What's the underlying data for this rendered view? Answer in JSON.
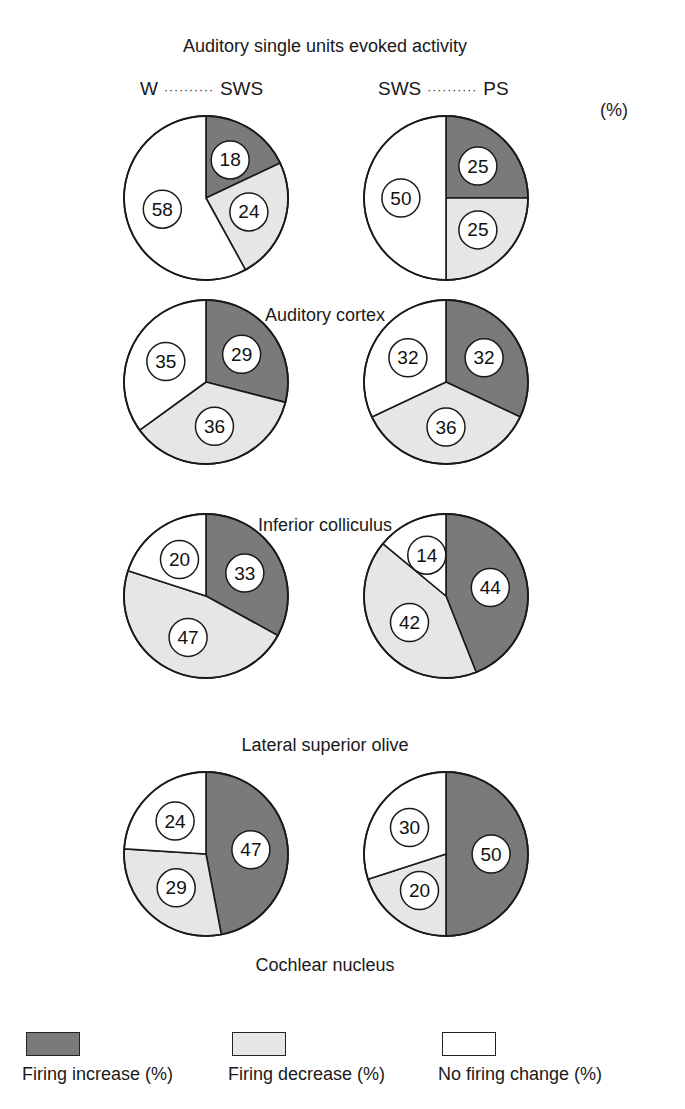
{
  "title": "Auditory single units evoked activity",
  "column_headers": [
    {
      "left": "W",
      "right": "SWS"
    },
    {
      "left": "SWS",
      "right": "PS"
    }
  ],
  "column_dots": "··········",
  "unit_label": "(%)",
  "colors": {
    "increase": "#7a7a7a",
    "decrease": "#e6e6e6",
    "no_change": "#ffffff",
    "stroke": "#1a1a1a"
  },
  "legend": [
    {
      "key": "increase",
      "label": "Firing increase (%)"
    },
    {
      "key": "decrease",
      "label": "Firing decrease (%)"
    },
    {
      "key": "no_change",
      "label": "No firing change (%)"
    }
  ],
  "chart_data": {
    "type": "pie",
    "title": "Auditory single units evoked activity",
    "unit": "%",
    "series_order": [
      "Firing increase",
      "Firing decrease",
      "No firing change"
    ],
    "columns": [
      "W → SWS",
      "SWS → PS"
    ],
    "rows": [
      {
        "region": "Auditory cortex",
        "pies": [
          {
            "transition": "W-SWS",
            "increase": 18,
            "decrease": 24,
            "no_change": 58
          },
          {
            "transition": "SWS-PS",
            "increase": 25,
            "decrease": 25,
            "no_change": 50
          }
        ]
      },
      {
        "region": "Inferior colliculus",
        "pies": [
          {
            "transition": "W-SWS",
            "increase": 29,
            "decrease": 36,
            "no_change": 35
          },
          {
            "transition": "SWS-PS",
            "increase": 32,
            "decrease": 36,
            "no_change": 32
          }
        ]
      },
      {
        "region": "Lateral superior olive",
        "pies": [
          {
            "transition": "W-SWS",
            "increase": 33,
            "decrease": 47,
            "no_change": 20
          },
          {
            "transition": "SWS-PS",
            "increase": 44,
            "decrease": 42,
            "no_change": 14
          }
        ]
      },
      {
        "region": "Cochlear nucleus",
        "pies": [
          {
            "transition": "W-SWS",
            "increase": 47,
            "decrease": 29,
            "no_change": 24
          },
          {
            "transition": "SWS-PS",
            "increase": 50,
            "decrease": 20,
            "no_change": 30
          }
        ]
      }
    ],
    "legend_position": "bottom"
  }
}
